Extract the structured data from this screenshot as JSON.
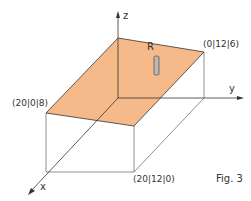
{
  "figure": {
    "caption": "Fig. 3",
    "axes": {
      "x": "x",
      "y": "y",
      "z": "z"
    },
    "points": {
      "p1": "(20|0|8)",
      "p2": "(0|12|6)",
      "p3": "(20|12|0)"
    },
    "rod_label": "R",
    "colors": {
      "plane_fill": "#F5B98A",
      "line": "#333333",
      "rod": "#B8B8B8"
    }
  }
}
